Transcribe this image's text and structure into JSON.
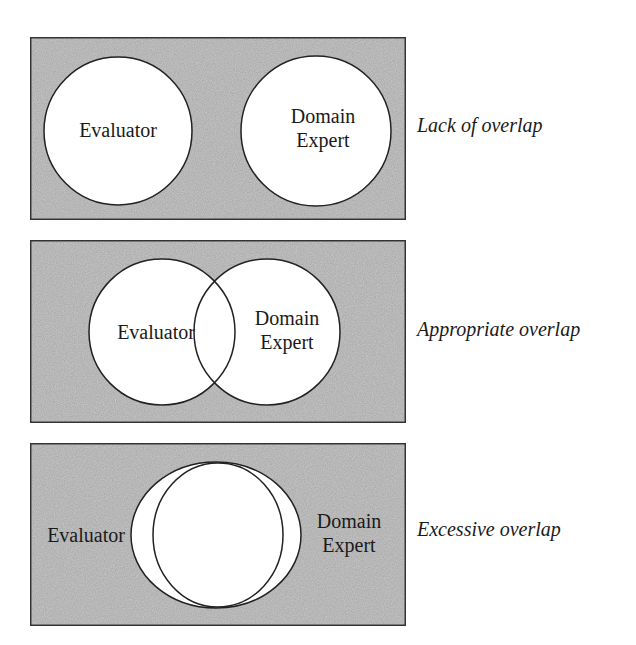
{
  "colors": {
    "background": "#ffffff",
    "panel_fill": "#c9c9c9",
    "panel_border": "#333333",
    "circle_fill": "#ffffff",
    "circle_stroke": "#222222",
    "text": "#1a1a1a"
  },
  "panels": [
    {
      "caption": "Lack of overlap",
      "left_label": "Evaluator",
      "right_label_line1": "Domain",
      "right_label_line2": "Expert"
    },
    {
      "caption": "Appropriate overlap",
      "left_label": "Evaluator",
      "right_label_line1": "Domain",
      "right_label_line2": "Expert"
    },
    {
      "caption": "Excessive overlap",
      "left_label": "Evaluator",
      "right_label_line1": "Domain",
      "right_label_line2": "Expert"
    }
  ]
}
